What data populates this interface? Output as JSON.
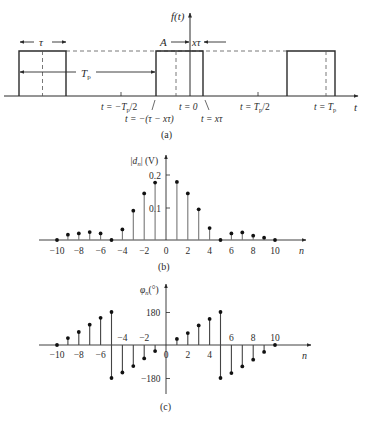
{
  "figure": {
    "panel_a": {
      "label": "(a)",
      "y_axis_label": "f(t)",
      "x_axis_label": "t",
      "amplitude_label": "A",
      "width_label": "τ",
      "period_label": "T",
      "period_subscript": "p",
      "offset_label": "xτ",
      "tick_labels": {
        "neg_half_period": "t = −T",
        "neg_half_period_tail": "/2",
        "zero": "t = 0",
        "pos_half_period": "t = T",
        "pos_half_period_tail": "/2",
        "period": "t = T",
        "pulse_start": "t = −(τ − xτ)",
        "pulse_end": "t = xτ"
      },
      "pulses": [
        {
          "start_px": 19,
          "end_px": 66
        },
        {
          "start_px": 156,
          "end_px": 203
        },
        {
          "start_px": 287,
          "end_px": 335
        }
      ]
    },
    "panel_b": {
      "label": "(b)",
      "y_axis_label_main": "|d",
      "y_axis_label_sub": "n",
      "y_axis_label_tail": "| (V)",
      "x_axis_label": "n",
      "y_ticks": [
        "0.1",
        "0.2"
      ],
      "x_ticks": [
        "−10",
        "−8",
        "−6",
        "−4",
        "−2",
        "0",
        "2",
        "4",
        "6",
        "8",
        "10"
      ]
    },
    "panel_c": {
      "label": "(c)",
      "y_axis_label_main": "φ",
      "y_axis_label_sub": "n",
      "y_axis_label_tail": "(°)",
      "x_axis_label": "n",
      "y_ticks": [
        "180",
        "−180"
      ],
      "x_ticks_below": [
        "−10",
        "−8",
        "−6",
        "0",
        "2",
        "4"
      ],
      "x_ticks_above": [
        "−4",
        "−2",
        "6",
        "8",
        "10"
      ]
    }
  },
  "chart_data": [
    {
      "type": "line",
      "title": "(a) Periodic rectangular pulse train f(t)",
      "xlabel": "t",
      "ylabel": "f(t)",
      "annotations": [
        "A",
        "τ",
        "T_p",
        "xτ",
        "t = −T_p/2",
        "t = 0",
        "t = T_p/2",
        "t = T_p",
        "t = −(τ − xτ)",
        "t = xτ"
      ],
      "description": "Pulses of amplitude A and width τ repeating with period T_p; the pulse near the origin spans t = −(τ − xτ) to t = xτ"
    },
    {
      "type": "scatter",
      "subtype": "stem",
      "title": "(b) Magnitude spectrum",
      "xlabel": "n",
      "ylabel": "|d_n| (V)",
      "ylim": [
        0,
        0.22
      ],
      "xlim": [
        -11,
        11
      ],
      "x": [
        -10,
        -9,
        -8,
        -7,
        -6,
        -5,
        -4,
        -3,
        -2,
        -1,
        0,
        1,
        2,
        3,
        4,
        5,
        6,
        7,
        8,
        9,
        10
      ],
      "values": [
        0,
        0.016,
        0.02,
        0.024,
        0.02,
        0,
        0.032,
        0.089,
        0.141,
        0.174,
        0.2,
        0.176,
        0.141,
        0.093,
        0.036,
        0,
        0.02,
        0.023,
        0.013,
        0.007,
        0
      ],
      "note": "n = 0 sample coincides with the vertical axis"
    },
    {
      "type": "scatter",
      "subtype": "stem",
      "title": "(c) Phase spectrum",
      "xlabel": "n",
      "ylabel": "φ_n (°)",
      "ylim": [
        -200,
        200
      ],
      "xlim": [
        -11,
        11
      ],
      "x": [
        -10,
        -9,
        -8,
        -7,
        -6,
        -5,
        -4,
        -3,
        -2,
        -1,
        0,
        1,
        2,
        3,
        4,
        5,
        6,
        7,
        8,
        9,
        10
      ],
      "values": [
        0,
        38,
        71,
        111,
        148,
        180,
        -150,
        -115,
        -73,
        -33,
        0,
        33,
        65,
        107,
        142,
        180,
        -153,
        -117,
        -80,
        -38,
        0
      ],
      "extra_points": [
        {
          "x": -5,
          "y": -180
        },
        {
          "x": 5,
          "y": -180
        }
      ]
    }
  ]
}
